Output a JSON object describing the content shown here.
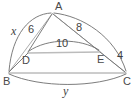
{
  "figure": {
    "kind": "geometry-diagram",
    "colors": {
      "stroke": "#6e6e6e",
      "stroke_light": "#b9b9b9",
      "text": "#3f3f3f",
      "background": "#ffffff"
    },
    "vertices": [
      {
        "id": "A",
        "label": "A",
        "x": 52,
        "y": 12
      },
      {
        "id": "D",
        "label": "D",
        "x": 28,
        "y": 53
      },
      {
        "id": "E",
        "label": "E",
        "x": 100,
        "y": 52
      },
      {
        "id": "B",
        "label": "B",
        "x": 8,
        "y": 73
      },
      {
        "id": "C",
        "label": "C",
        "x": 126,
        "y": 73
      }
    ],
    "segments": [
      {
        "id": "AD",
        "from": "A",
        "to": "D",
        "style": "solid"
      },
      {
        "id": "AE",
        "from": "A",
        "to": "E",
        "style": "solid"
      },
      {
        "id": "AB-seg",
        "from": "A",
        "to": "B",
        "style": "solid"
      },
      {
        "id": "AC-seg",
        "from": "A",
        "to": "C",
        "style": "solid"
      },
      {
        "id": "DE",
        "from": "D",
        "to": "E",
        "style": "light"
      },
      {
        "id": "DB",
        "from": "D",
        "to": "B",
        "style": "solid"
      },
      {
        "id": "EC",
        "from": "E",
        "to": "C",
        "style": "solid"
      },
      {
        "id": "BC",
        "from": "B",
        "to": "C",
        "style": "solid"
      }
    ],
    "arcs": [
      {
        "id": "arc-AB",
        "from": "A",
        "to": "B",
        "bulge": "left",
        "label": "x"
      },
      {
        "id": "arc-AC",
        "from": "A",
        "to": "C",
        "bulge": "right",
        "label": ""
      },
      {
        "id": "arc-DE",
        "from": "D",
        "to": "E",
        "bulge": "up",
        "label": "10"
      },
      {
        "id": "arc-BC",
        "from": "B",
        "to": "C",
        "bulge": "down",
        "label": "y"
      }
    ],
    "measures": [
      {
        "id": "m-x",
        "text": "x",
        "kind": "variable",
        "for": "AB",
        "x": 11,
        "y": 25
      },
      {
        "id": "m-6",
        "text": "6",
        "kind": "number",
        "for": "AD",
        "x": 28,
        "y": 24
      },
      {
        "id": "m-8",
        "text": "8",
        "kind": "number",
        "for": "AE",
        "x": 76,
        "y": 22
      },
      {
        "id": "m-10",
        "text": "10",
        "kind": "number",
        "for": "DE",
        "x": 56,
        "y": 38
      },
      {
        "id": "m-4",
        "text": "4",
        "kind": "number",
        "for": "EC",
        "x": 117,
        "y": 50
      },
      {
        "id": "m-y",
        "text": "y",
        "kind": "variable",
        "for": "BC",
        "x": 63,
        "y": 85
      }
    ],
    "vertex_labels": [
      {
        "id": "lbl-A",
        "text": "A",
        "x": 55,
        "y": 1
      },
      {
        "id": "lbl-D",
        "text": "D",
        "x": 22,
        "y": 55
      },
      {
        "id": "lbl-E",
        "text": "E",
        "x": 97,
        "y": 54
      },
      {
        "id": "lbl-B",
        "text": "B",
        "x": 3,
        "y": 76
      },
      {
        "id": "lbl-C",
        "text": "C",
        "x": 123,
        "y": 76
      }
    ]
  }
}
